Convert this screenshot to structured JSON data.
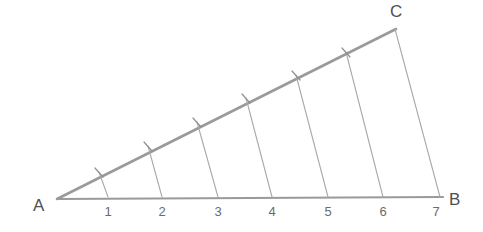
{
  "figure": {
    "type": "geometry-diagram",
    "background_color": "#ffffff",
    "width": 483,
    "height": 232
  },
  "style": {
    "baseline_color": "#9a9a9a",
    "hypotenuse_color": "#9a9a9a",
    "transversal_color": "#a9a9a9",
    "tick_color": "#8f8f8f",
    "vertex_label_color": "#4f4f4f",
    "division_label_color": "#6b6b6b",
    "baseline_width": 2.2,
    "hypotenuse_width": 2.6,
    "transversal_width": 1.1,
    "tick_width": 1.2
  },
  "vertices": [
    {
      "name": "A",
      "label": "A",
      "x": 57,
      "y": 199,
      "label_x": 33,
      "label_y": 211
    },
    {
      "name": "B",
      "label": "B",
      "x": 440,
      "y": 197,
      "label_x": 449,
      "label_y": 205
    },
    {
      "name": "C",
      "label": "C",
      "x": 395,
      "y": 29,
      "label_x": 390,
      "label_y": 17
    }
  ],
  "baseline": {
    "name": "segment-AB",
    "from": {
      "x": 57,
      "y": 199
    },
    "to": {
      "x": 443,
      "y": 197
    }
  },
  "hypotenuse": {
    "name": "segment-AC",
    "from": {
      "x": 57,
      "y": 199
    },
    "to": {
      "x": 396,
      "y": 29
    }
  },
  "closing_side": {
    "name": "segment-CB",
    "from": {
      "x": 395,
      "y": 29
    },
    "to": {
      "x": 440,
      "y": 197
    }
  },
  "divisions": [
    {
      "label": "1",
      "base_x": 108,
      "base_y": 197,
      "top_x": 99,
      "top_y": 172,
      "label_x": 108,
      "label_y": 215
    },
    {
      "label": "2",
      "base_x": 162,
      "base_y": 197,
      "top_x": 148,
      "top_y": 146,
      "label_x": 162,
      "label_y": 215
    },
    {
      "label": "3",
      "base_x": 218,
      "base_y": 197,
      "top_x": 197,
      "top_y": 122,
      "label_x": 218,
      "label_y": 215
    },
    {
      "label": "4",
      "base_x": 272,
      "base_y": 197,
      "top_x": 246,
      "top_y": 98,
      "label_x": 272,
      "label_y": 215
    },
    {
      "label": "5",
      "base_x": 328,
      "base_y": 197,
      "top_x": 296,
      "top_y": 75,
      "label_x": 328,
      "label_y": 215
    },
    {
      "label": "6",
      "base_x": 383,
      "base_y": 197,
      "top_x": 346,
      "top_y": 52,
      "label_x": 383,
      "label_y": 215
    },
    {
      "label": "7",
      "base_x": 440,
      "base_y": 197,
      "top_x": 395,
      "top_y": 29,
      "label_x": 436,
      "label_y": 215
    }
  ],
  "tick_marks": [
    {
      "cx": 99,
      "cy": 172
    },
    {
      "cx": 148,
      "cy": 146
    },
    {
      "cx": 197,
      "cy": 122
    },
    {
      "cx": 246,
      "cy": 98
    },
    {
      "cx": 296,
      "cy": 75
    },
    {
      "cx": 346,
      "cy": 52
    }
  ]
}
